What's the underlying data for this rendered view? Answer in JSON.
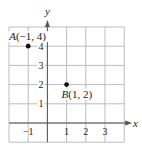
{
  "chart_data": {
    "type": "scatter",
    "title": "",
    "xlabel": "x",
    "ylabel": "y",
    "xlim": [
      -2,
      4
    ],
    "ylim": [
      -1,
      5
    ],
    "grid": true,
    "x_ticks": [
      -1,
      1,
      2,
      3
    ],
    "x_tick_labels": [
      "−1",
      "1",
      "2",
      "3"
    ],
    "y_ticks": [
      1,
      2,
      3,
      4
    ],
    "y_tick_labels": [
      "1",
      "2",
      "3",
      "4"
    ],
    "points": [
      {
        "name": "A",
        "x": -1,
        "y": 4,
        "label": "A(−1, 4)"
      },
      {
        "name": "B",
        "x": 1,
        "y": 2,
        "label": "B(1, 2)"
      }
    ],
    "colors": {
      "grid": "#bdbdbd",
      "axis": "#555555",
      "point": "#111111"
    }
  }
}
